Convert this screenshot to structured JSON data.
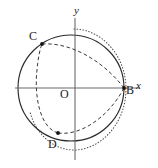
{
  "figure": {
    "kind": "geometry-diagram",
    "canvas": {
      "width": 158,
      "height": 168,
      "background": "#ffffff"
    },
    "axes": {
      "origin": {
        "x": 75,
        "y": 88
      },
      "x_axis": {
        "x1": 15,
        "y1": 88,
        "x2": 140,
        "y2": 88,
        "color": "#6b6b6b"
      },
      "y_axis": {
        "x1": 75,
        "y1": 18,
        "x2": 75,
        "y2": 160,
        "color": "#6b6b6b"
      },
      "x_label": "x",
      "y_label": "y",
      "origin_label": "O"
    },
    "points": [
      {
        "name": "C",
        "label": "C",
        "x": 42,
        "y": 44,
        "marker": "dot"
      },
      {
        "name": "B",
        "label": "B",
        "x": 124,
        "y": 88,
        "marker": "dot"
      },
      {
        "name": "D",
        "label": "D",
        "x": 58,
        "y": 133,
        "marker": "dot"
      }
    ],
    "curves": [
      {
        "name": "solid-circle",
        "style": "solid",
        "color": "#2b2b2b",
        "shape": "circle",
        "center": {
          "x": 71,
          "y": 88
        },
        "radius": 53
      },
      {
        "name": "dotted-oval",
        "style": "dotted",
        "color": "#4a4a4a",
        "shape": "ellipse-arc",
        "center": {
          "x": 74,
          "y": 89
        },
        "rx": 52,
        "ry": 60
      },
      {
        "name": "dashed-ellipse",
        "style": "dashed",
        "color": "#3a3a3a",
        "shape": "rotated-ellipse",
        "through": [
          "C",
          "D",
          "B"
        ]
      }
    ]
  },
  "labels": {
    "y_axis": "y",
    "x_axis": "x",
    "origin": "O",
    "point_c": "C",
    "point_b": "B",
    "point_d": "D"
  }
}
